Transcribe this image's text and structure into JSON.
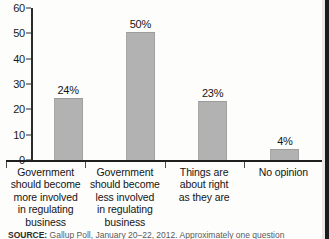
{
  "chart_data": {
    "type": "bar",
    "title": "",
    "subtitle": "",
    "xlabel": "",
    "ylabel": "",
    "ylim": [
      0,
      60
    ],
    "ytick_step": 10,
    "yticks": [
      "60",
      "50",
      "40",
      "30",
      "20",
      "10",
      "0"
    ],
    "grid": false,
    "legend": false,
    "categories": [
      "Government should become more involved in regulating business",
      "Government should become less involved in regulating business",
      "Things are about right as they are",
      "No opinion"
    ],
    "category_lines": [
      [
        "Government",
        "should become",
        "more involved",
        "in regulating",
        "business"
      ],
      [
        "Government",
        "should become",
        "less involved",
        "in regulating",
        "business"
      ],
      [
        "Things are",
        "about right",
        "as they are"
      ],
      [
        "No opinion"
      ]
    ],
    "values": [
      24,
      50,
      23,
      4
    ],
    "value_labels": [
      "24%",
      "50%",
      "23%",
      "4%"
    ],
    "bar_color": "#b2b2b2",
    "axis_color": "#1f1f1f",
    "text_color": "#141414"
  },
  "source": {
    "label": "SOURCE:",
    "text": "Gallup Poll, January 20–22, 2012. Approximately one question"
  }
}
